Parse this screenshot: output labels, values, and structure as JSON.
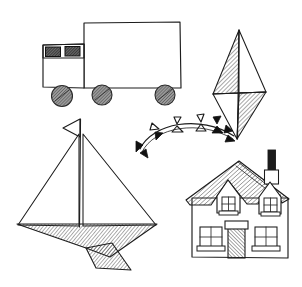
{
  "canvas": {
    "width": 302,
    "height": 287,
    "background_color": "#ffffff",
    "ink_color": "#1c1c1c",
    "style": "hand-drawn pen-and-ink line sketch with hatched shading",
    "title": "Sketch of four toy objects: truck, kite, sailboat, house"
  },
  "objects": [
    {
      "id": "truck",
      "label": "Delivery truck",
      "parts": [
        "cargo-box",
        "cab",
        "cab-windows",
        "wheels"
      ],
      "wheel_count": 3,
      "window_count": 2,
      "shading": "hatched windows and wheels"
    },
    {
      "id": "kite",
      "label": "Diamond kite with ribbon tail",
      "parts": [
        "diamond-body",
        "spar-cross",
        "tail-arc",
        "tail-bows"
      ],
      "tail_bow_count": 7,
      "shading": "upper-left and lower-right quadrants hatched"
    },
    {
      "id": "sailboat",
      "label": "Sailboat with pennant flag",
      "parts": [
        "pennant-flag",
        "mast",
        "fore-sail",
        "main-sail",
        "hull",
        "keel"
      ],
      "sail_count": 2,
      "shading": "diagonally hatched hull and keel"
    },
    {
      "id": "house",
      "label": "Cottage house with chimney",
      "parts": [
        "roof",
        "chimney",
        "dormer-windows",
        "walls",
        "front-door",
        "lower-windows"
      ],
      "dormer_count": 2,
      "lower_window_count": 2,
      "door_count": 1,
      "shading": "hatched roof and door"
    }
  ],
  "colors": {
    "ink": "#1c1c1c",
    "hatch": "#3a3a3a",
    "solid_fill": "#111111",
    "paper": "#ffffff"
  }
}
